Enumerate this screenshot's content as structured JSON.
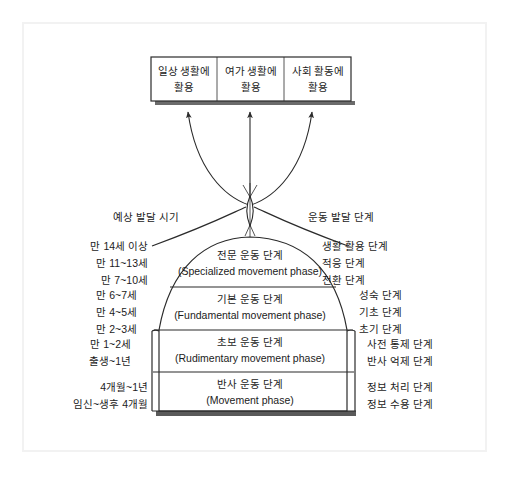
{
  "diagram": {
    "title_left": "예상 발달 시기",
    "title_right": "운동 발달 단계",
    "top_box": {
      "cells": [
        {
          "line1": "일상 생활에",
          "line2": "활용"
        },
        {
          "line1": "여가 생활에",
          "line2": "활용"
        },
        {
          "line1": "사회 활동에",
          "line2": "활용"
        }
      ]
    },
    "phases": [
      {
        "ko": "전문 운동 단계",
        "en": "(Specialized movement phase)",
        "ages": [
          "만 14세 이상",
          "만 11~13세",
          "만 7~10세"
        ],
        "stages": [
          "생활 활용 단계",
          "적응 단계",
          "전환 단계"
        ]
      },
      {
        "ko": "기본 운동 단계",
        "en": "(Fundamental movement phase)",
        "ages": [
          "만 6~7세",
          "만 4~5세",
          "만 2~3세"
        ],
        "stages": [
          "성숙 단계",
          "기초 단계",
          "초기 단계"
        ]
      },
      {
        "ko": "초보 운동 단계",
        "en": "(Rudimentary movement phase)",
        "ages": [
          "만 1~2세",
          "출생~1년"
        ],
        "stages": [
          "사전 통제 단계",
          "반사 억제 단계"
        ]
      },
      {
        "ko": "반사 운동 단계",
        "en": "(Movement phase)",
        "ages": [
          "4개월~1년",
          "임신~생후 4개월"
        ],
        "stages": [
          "정보 처리 단계",
          "정보 수용 단계"
        ]
      }
    ],
    "colors": {
      "ink": "#1b1b1b",
      "line": "#2b2b2b",
      "frame": "#f2f2f2",
      "shadow": "#555555",
      "background": "#ffffff"
    }
  }
}
